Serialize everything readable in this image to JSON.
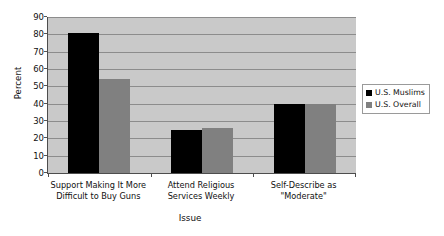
{
  "chart_data": {
    "type": "bar",
    "title": "",
    "xlabel": "Issue",
    "ylabel": "Percent",
    "categories": [
      "Support Making It More Difficult to Buy Guns",
      "Attend Religious Services Weekly",
      "Self-Describe as \"Moderate\""
    ],
    "category_lines": [
      [
        "Support Making It More",
        "Difficult to Buy Guns"
      ],
      [
        "Attend Religious",
        "Services Weekly"
      ],
      [
        "Self-Describe as",
        "\"Moderate\""
      ]
    ],
    "series": [
      {
        "name": "U.S. Muslims",
        "color": "#000000",
        "values": [
          81,
          25,
          40
        ]
      },
      {
        "name": "U.S. Overall",
        "color": "#808080",
        "values": [
          54,
          26,
          40
        ]
      }
    ],
    "ylim": [
      0,
      90
    ],
    "ytick_step": 10,
    "yticks": [
      0,
      10,
      20,
      30,
      40,
      50,
      60,
      70,
      80,
      90
    ],
    "grid": true,
    "legend_position": "right",
    "plot_background": "#c9c9c9",
    "page_background": "#ffffff",
    "axis_color": "#4d4d4d",
    "gridline_color": "#8c8c8c"
  }
}
